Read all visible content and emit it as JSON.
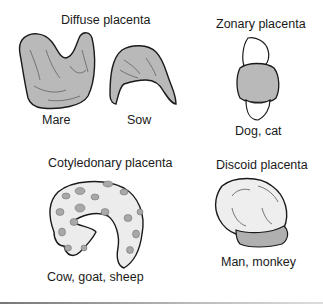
{
  "diagram": {
    "panels": [
      {
        "title": "Diffuse placenta",
        "examples": [
          "Mare",
          "Sow"
        ]
      },
      {
        "title": "Zonary placenta",
        "examples": [
          "Dog, cat"
        ]
      },
      {
        "title": "Cotyledonary placenta",
        "examples": [
          "Cow, goat, sheep"
        ]
      },
      {
        "title": "Discoid placenta",
        "examples": [
          "Man, monkey"
        ]
      }
    ],
    "colors": {
      "tissue_fill": "#b9b9b9",
      "outline": "#1a1a1a",
      "light_fill": "#ebebeb",
      "cotyledon_fill": "#a8a8a8"
    }
  }
}
